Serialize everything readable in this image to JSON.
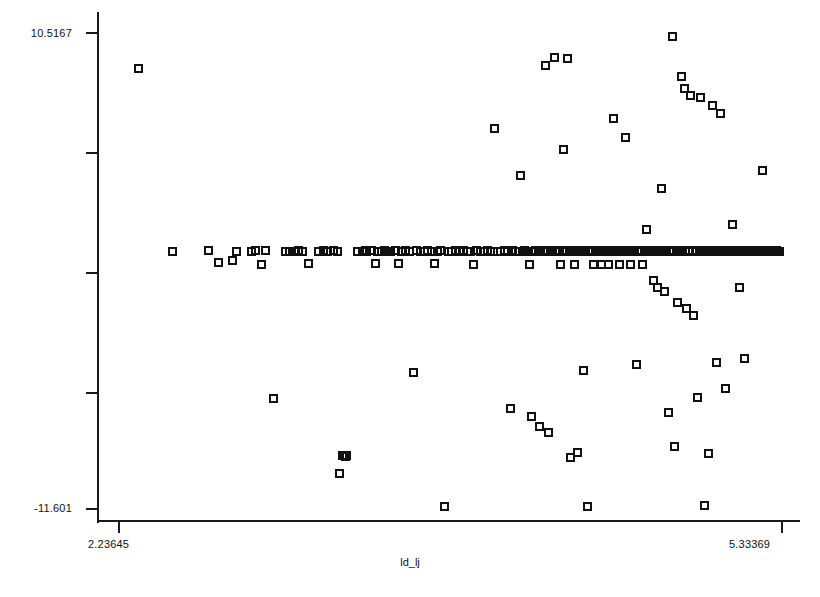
{
  "chart_data": {
    "type": "scatter",
    "title": "",
    "xlabel": "ld_lj",
    "ylabel": "",
    "xlim": [
      2.23645,
      5.33369
    ],
    "ylim": [
      -11.601,
      10.5167
    ],
    "grid": false,
    "legend": null,
    "marker": "open-square",
    "marker_size_px": 9,
    "x_tick_labels": [
      "2.23645",
      "5.33369"
    ],
    "y_tick_labels": [
      "10.5167",
      "-11.601"
    ],
    "y_tick_count": 5,
    "x_tick_count": 2,
    "n_points": 222,
    "points": [
      [
        2.333,
        8.83
      ],
      [
        2.489,
        0.34
      ],
      [
        2.657,
        0.35
      ],
      [
        2.705,
        -0.19
      ],
      [
        2.771,
        -0.08
      ],
      [
        2.792,
        0.34
      ],
      [
        2.861,
        0.34
      ],
      [
        2.879,
        0.35
      ],
      [
        2.905,
        -0.29
      ],
      [
        2.927,
        0.36
      ],
      [
        2.961,
        -6.5
      ],
      [
        3.019,
        0.34
      ],
      [
        3.039,
        0.31
      ],
      [
        3.061,
        0.33
      ],
      [
        3.079,
        0.35
      ],
      [
        3.099,
        0.34
      ],
      [
        3.125,
        -0.22
      ],
      [
        3.173,
        0.33
      ],
      [
        3.195,
        0.36
      ],
      [
        3.215,
        0.33
      ],
      [
        3.241,
        0.35
      ],
      [
        3.263,
        0.33
      ],
      [
        3.285,
        -9.15
      ],
      [
        3.291,
        -9.16
      ],
      [
        3.297,
        -9.2
      ],
      [
        3.302,
        -9.18
      ],
      [
        3.272,
        -10.0
      ],
      [
        3.355,
        0.34
      ],
      [
        3.377,
        0.34
      ],
      [
        3.391,
        0.35
      ],
      [
        3.399,
        0.34
      ],
      [
        3.42,
        0.35
      ],
      [
        3.438,
        -0.25
      ],
      [
        3.449,
        0.33
      ],
      [
        3.468,
        0.34
      ],
      [
        3.481,
        0.36
      ],
      [
        3.492,
        0.34
      ],
      [
        3.509,
        0.33
      ],
      [
        3.533,
        0.35
      ],
      [
        3.549,
        -0.26
      ],
      [
        3.561,
        0.34
      ],
      [
        3.578,
        0.35
      ],
      [
        3.599,
        0.34
      ],
      [
        3.616,
        -5.29
      ],
      [
        3.633,
        0.35
      ],
      [
        3.651,
        0.34
      ],
      [
        3.669,
        0.33
      ],
      [
        3.681,
        0.35
      ],
      [
        3.699,
        0.34
      ],
      [
        3.714,
        -0.26
      ],
      [
        3.728,
        0.34
      ],
      [
        3.745,
        0.35
      ],
      [
        3.762,
        -11.55
      ],
      [
        3.779,
        0.34
      ],
      [
        3.795,
        0.33
      ],
      [
        3.811,
        0.35
      ],
      [
        3.832,
        0.34
      ],
      [
        3.851,
        0.36
      ],
      [
        3.869,
        0.33
      ],
      [
        3.882,
        0.34
      ],
      [
        3.899,
        -0.28
      ],
      [
        3.913,
        0.35
      ],
      [
        3.931,
        0.34
      ],
      [
        3.949,
        0.33
      ],
      [
        3.962,
        0.35
      ],
      [
        3.978,
        0.34
      ],
      [
        3.993,
        6.04
      ],
      [
        4.011,
        0.34
      ],
      [
        4.025,
        0.33
      ],
      [
        4.041,
        0.35
      ],
      [
        4.058,
        0.34
      ],
      [
        4.069,
        -7.0
      ],
      [
        4.079,
        0.35
      ],
      [
        4.094,
        0.34
      ],
      [
        4.108,
        0.33
      ],
      [
        4.119,
        3.84
      ],
      [
        4.125,
        0.34
      ],
      [
        4.137,
        0.35
      ],
      [
        4.149,
        0.33
      ],
      [
        4.161,
        -0.27
      ],
      [
        4.169,
        -7.35
      ],
      [
        4.176,
        0.34
      ],
      [
        4.188,
        0.35
      ],
      [
        4.199,
        0.34
      ],
      [
        4.205,
        -7.8
      ],
      [
        4.212,
        0.33
      ],
      [
        4.224,
        0.35
      ],
      [
        4.233,
        8.95
      ],
      [
        4.241,
        0.34
      ],
      [
        4.249,
        -8.1
      ],
      [
        4.257,
        0.34
      ],
      [
        4.268,
        0.35
      ],
      [
        4.275,
        9.35
      ],
      [
        4.279,
        0.33
      ],
      [
        4.288,
        0.34
      ],
      [
        4.297,
        0.35
      ],
      [
        4.305,
        -0.3
      ],
      [
        4.312,
        0.34
      ],
      [
        4.319,
        5.05
      ],
      [
        4.325,
        0.33
      ],
      [
        4.332,
        0.35
      ],
      [
        4.338,
        9.3
      ],
      [
        4.344,
        0.34
      ],
      [
        4.351,
        -9.25
      ],
      [
        4.357,
        0.35
      ],
      [
        4.363,
        0.33
      ],
      [
        4.369,
        -0.28
      ],
      [
        4.375,
        0.34
      ],
      [
        4.381,
        -9.0
      ],
      [
        4.388,
        0.35
      ],
      [
        4.395,
        0.34
      ],
      [
        4.401,
        0.33
      ],
      [
        4.409,
        -5.2
      ],
      [
        4.415,
        0.35
      ],
      [
        4.421,
        0.34
      ],
      [
        4.428,
        -11.55
      ],
      [
        4.434,
        0.33
      ],
      [
        4.441,
        0.34
      ],
      [
        4.447,
        0.35
      ],
      [
        4.453,
        0.34
      ],
      [
        4.459,
        -0.29
      ],
      [
        4.465,
        0.33
      ],
      [
        4.471,
        0.35
      ],
      [
        4.477,
        0.34
      ],
      [
        4.483,
        0.34
      ],
      [
        4.489,
        0.35
      ],
      [
        4.495,
        -0.3
      ],
      [
        4.501,
        0.33
      ],
      [
        4.507,
        0.34
      ],
      [
        4.513,
        0.35
      ],
      [
        4.519,
        0.34
      ],
      [
        4.526,
        -0.28
      ],
      [
        4.532,
        0.33
      ],
      [
        4.538,
        0.35
      ],
      [
        4.545,
        0.34
      ],
      [
        4.551,
        6.5
      ],
      [
        4.557,
        0.33
      ],
      [
        4.563,
        0.34
      ],
      [
        4.569,
        0.35
      ],
      [
        4.575,
        0.34
      ],
      [
        4.581,
        -0.3
      ],
      [
        4.588,
        0.33
      ],
      [
        4.594,
        0.35
      ],
      [
        4.601,
        0.34
      ],
      [
        4.607,
        5.6
      ],
      [
        4.613,
        0.34
      ],
      [
        4.619,
        0.35
      ],
      [
        4.625,
        0.33
      ],
      [
        4.631,
        -0.29
      ],
      [
        4.638,
        0.34
      ],
      [
        4.644,
        0.35
      ],
      [
        4.651,
        0.34
      ],
      [
        4.657,
        -4.95
      ],
      [
        4.663,
        0.33
      ],
      [
        4.669,
        0.35
      ],
      [
        4.675,
        0.34
      ],
      [
        4.681,
        0.34
      ],
      [
        4.688,
        -0.28
      ],
      [
        4.694,
        0.33
      ],
      [
        4.701,
        0.35
      ],
      [
        4.707,
        1.35
      ],
      [
        4.713,
        0.34
      ],
      [
        4.719,
        0.33
      ],
      [
        4.726,
        0.35
      ],
      [
        4.732,
        0.34
      ],
      [
        4.738,
        -1.05
      ],
      [
        4.745,
        0.34
      ],
      [
        4.751,
        0.35
      ],
      [
        4.757,
        -1.35
      ],
      [
        4.763,
        0.33
      ],
      [
        4.769,
        0.34
      ],
      [
        4.776,
        3.25
      ],
      [
        4.782,
        0.35
      ],
      [
        4.788,
        -1.55
      ],
      [
        4.794,
        0.34
      ],
      [
        4.801,
        0.33
      ],
      [
        4.807,
        -7.15
      ],
      [
        4.813,
        0.35
      ],
      [
        4.819,
        0.34
      ],
      [
        4.825,
        10.3
      ],
      [
        4.832,
        0.34
      ],
      [
        4.838,
        -8.75
      ],
      [
        4.844,
        0.35
      ],
      [
        4.851,
        -2.05
      ],
      [
        4.857,
        0.33
      ],
      [
        4.863,
        0.34
      ],
      [
        4.869,
        8.45
      ],
      [
        4.875,
        0.35
      ],
      [
        4.882,
        7.9
      ],
      [
        4.888,
        0.34
      ],
      [
        4.894,
        -2.35
      ],
      [
        4.901,
        0.33
      ],
      [
        4.907,
        0.35
      ],
      [
        4.913,
        7.55
      ],
      [
        4.919,
        0.34
      ],
      [
        4.926,
        -2.65
      ],
      [
        4.932,
        0.34
      ],
      [
        4.938,
        0.35
      ],
      [
        4.944,
        -6.45
      ],
      [
        4.951,
        0.33
      ],
      [
        4.957,
        7.45
      ],
      [
        4.963,
        0.34
      ],
      [
        4.969,
        0.35
      ],
      [
        4.976,
        -11.5
      ],
      [
        4.982,
        0.34
      ],
      [
        4.988,
        0.33
      ],
      [
        4.994,
        -9.05
      ],
      [
        5.001,
        0.35
      ],
      [
        5.007,
        0.34
      ],
      [
        5.013,
        7.1
      ],
      [
        5.019,
        0.33
      ],
      [
        5.026,
        0.34
      ],
      [
        5.032,
        -4.85
      ],
      [
        5.038,
        0.35
      ],
      [
        5.045,
        0.34
      ],
      [
        5.051,
        6.75
      ],
      [
        5.057,
        0.33
      ],
      [
        5.063,
        0.34
      ],
      [
        5.069,
        0.35
      ],
      [
        5.076,
        -6.05
      ],
      [
        5.082,
        0.34
      ],
      [
        5.088,
        0.33
      ],
      [
        5.094,
        0.35
      ],
      [
        5.101,
        0.34
      ],
      [
        5.107,
        1.55
      ],
      [
        5.113,
        0.34
      ],
      [
        5.119,
        0.35
      ],
      [
        5.126,
        0.33
      ],
      [
        5.132,
        0.34
      ],
      [
        5.138,
        -1.35
      ],
      [
        5.145,
        0.35
      ],
      [
        5.151,
        0.34
      ],
      [
        5.157,
        0.33
      ],
      [
        5.163,
        -4.65
      ],
      [
        5.169,
        0.34
      ],
      [
        5.176,
        0.35
      ],
      [
        5.182,
        0.34
      ],
      [
        5.188,
        0.33
      ],
      [
        5.194,
        0.35
      ],
      [
        5.201,
        0.34
      ],
      [
        5.207,
        0.33
      ],
      [
        5.213,
        0.35
      ],
      [
        5.219,
        0.34
      ],
      [
        5.226,
        0.34
      ],
      [
        5.232,
        0.35
      ],
      [
        5.238,
        0.33
      ],
      [
        5.245,
        4.1
      ],
      [
        5.251,
        0.34
      ],
      [
        5.257,
        0.35
      ],
      [
        5.263,
        0.34
      ],
      [
        5.269,
        0.33
      ],
      [
        5.276,
        0.35
      ],
      [
        5.282,
        0.34
      ],
      [
        5.288,
        0.34
      ],
      [
        5.294,
        0.35
      ],
      [
        5.301,
        0.33
      ],
      [
        5.307,
        0.34
      ],
      [
        5.313,
        0.35
      ],
      [
        5.319,
        0.34
      ],
      [
        5.326,
        0.33
      ]
    ]
  },
  "axes": {
    "y_top_label": "10.5167",
    "y_bottom_label": "-11.601",
    "x_left_label": "2.23645",
    "x_right_label": "5.33369",
    "x_title": "ld_lj"
  },
  "colors": {
    "marker_stroke": "#111111",
    "axis": "#1a1a1a",
    "background": "#ffffff"
  }
}
